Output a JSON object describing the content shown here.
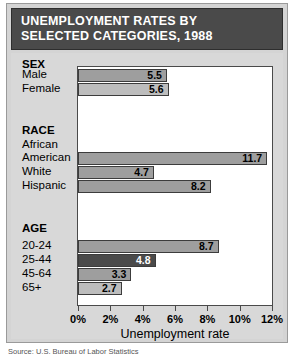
{
  "title": {
    "line1": "UNEMPLOYMENT RATES BY",
    "line2": "SELECTED CATEGORIES, 1988"
  },
  "axis_title": "Unemployment rate",
  "caption": "Source: U.S. Bureau of Labor Statistics",
  "colors": {
    "title_bar": "#4a4a4a",
    "panel_bg": "#d8d8d8",
    "plot_bg": "#ffffff",
    "bar_dark": "#4a4a4a",
    "bar_medium": "#9e9e9e",
    "bar_light": "#bdbdbd",
    "outline": "#3c3c3c"
  },
  "chart_data": {
    "type": "bar",
    "title": "UNEMPLOYMENT RATES BY SELECTED CATEGORIES, 1988",
    "xlabel": "Unemployment rate",
    "ylabel": "",
    "xlim": [
      0,
      12
    ],
    "orientation": "horizontal",
    "grid": false,
    "legend": "none",
    "xticks": [
      0,
      2,
      4,
      6,
      8,
      10,
      12
    ],
    "xtick_labels": [
      "0%",
      "2%",
      "4%",
      "6%",
      "8%",
      "10%",
      "12%"
    ],
    "groups": [
      {
        "name": "SEX",
        "items": [
          {
            "label": "Male",
            "value": 5.5,
            "display": "5.5",
            "style": "medium"
          },
          {
            "label": "Female",
            "value": 5.6,
            "display": "5.6",
            "style": "light"
          }
        ]
      },
      {
        "name": "RACE",
        "items": [
          {
            "label": "African American",
            "label_line1": "African",
            "label_line2": "American",
            "value": 11.7,
            "display": "11.7",
            "style": "medium"
          },
          {
            "label": "White",
            "value": 4.7,
            "display": "4.7",
            "style": "medium"
          },
          {
            "label": "Hispanic",
            "value": 8.2,
            "display": "8.2",
            "style": "medium"
          }
        ]
      },
      {
        "name": "AGE",
        "items": [
          {
            "label": "20-24",
            "value": 8.7,
            "display": "8.7",
            "style": "medium"
          },
          {
            "label": "25-44",
            "value": 4.8,
            "display": "4.8",
            "style": "dark"
          },
          {
            "label": "45-64",
            "value": 3.3,
            "display": "3.3",
            "style": "medium"
          },
          {
            "label": "65+",
            "value": 2.7,
            "display": "2.7",
            "style": "light"
          }
        ]
      }
    ]
  }
}
